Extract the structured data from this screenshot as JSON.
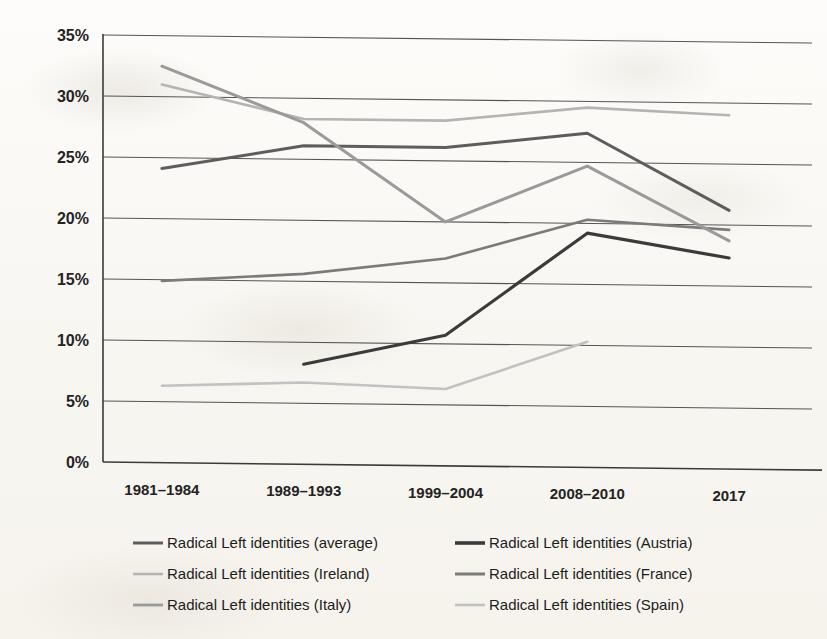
{
  "chart_data": {
    "type": "line",
    "title": "",
    "subtitle": "",
    "xlabel": "",
    "ylabel": "",
    "categories": [
      "1981–1984",
      "1989–1993",
      "1999–2004",
      "2008–2010",
      "2017"
    ],
    "ylim": [
      0,
      35
    ],
    "ytick_labels": [
      "0%",
      "5%",
      "10%",
      "15%",
      "20%",
      "25%",
      "30%",
      "35%"
    ],
    "ytick_values": [
      0,
      5,
      10,
      15,
      20,
      25,
      30,
      35
    ],
    "grid": "horizontal",
    "legend_position": "bottom",
    "legend_columns": 2,
    "value_suffix": "%",
    "series": [
      {
        "name": "Radical Left identities (average)",
        "color": "#5d5d5d",
        "width": 3.0,
        "values": [
          24.1,
          26.1,
          26.1,
          27.4,
          21.2
        ]
      },
      {
        "name": "Radical Left identities (Austria)",
        "color": "#3b3b3b",
        "width": 3.2,
        "values": [
          null,
          8.2,
          10.7,
          19.2,
          17.3
        ]
      },
      {
        "name": "Radical Left identities (Ireland)",
        "color": "#b4b4b4",
        "width": 2.6,
        "values": [
          31.0,
          28.3,
          28.3,
          29.5,
          29.0
        ]
      },
      {
        "name": "Radical Left identities (France)",
        "color": "#7b7b7b",
        "width": 2.6,
        "values": [
          14.9,
          15.6,
          17.0,
          20.3,
          19.6
        ]
      },
      {
        "name": "Radical Left identities (Italy)",
        "color": "#9a9a9a",
        "width": 3.0,
        "values": [
          32.5,
          28.0,
          20.0,
          24.7,
          18.7
        ]
      },
      {
        "name": "Radical Left identities (Spain)",
        "color": "#c2c2c2",
        "width": 2.6,
        "values": [
          6.3,
          6.7,
          6.3,
          10.3,
          null
        ]
      }
    ]
  },
  "legend": {
    "entries": [
      {
        "label": "Radical Left identities (average)",
        "color": "#5d5d5d",
        "width": 3.0
      },
      {
        "label": "Radical Left identities (Austria)",
        "color": "#3b3b3b",
        "width": 3.6
      },
      {
        "label": "Radical Left identities (Ireland)",
        "color": "#b4b4b4",
        "width": 2.6
      },
      {
        "label": "Radical Left identities (France)",
        "color": "#7b7b7b",
        "width": 3.0
      },
      {
        "label": "Radical Left identities (Italy)",
        "color": "#9a9a9a",
        "width": 2.8
      },
      {
        "label": "Radical Left identities (Spain)",
        "color": "#c2c2c2",
        "width": 2.6
      }
    ]
  },
  "axes": {
    "y_axis_name": "percentage-axis",
    "x_axis_name": "period-axis"
  }
}
